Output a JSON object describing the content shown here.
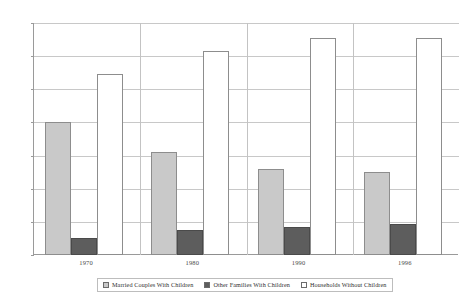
{
  "chart_data": {
    "type": "bar",
    "title": "",
    "subtitle": "",
    "xlabel": "",
    "ylabel": "",
    "categories": [
      "1970",
      "1980",
      "1990",
      "1996"
    ],
    "series": [
      {
        "name": "Married Couples With Children",
        "color": "#c9c9c9",
        "values": [
          40,
          31,
          26,
          25
        ]
      },
      {
        "name": "Other Families With Children",
        "color": "#5d5d5d",
        "values": [
          5,
          7.5,
          8.5,
          9.5
        ]
      },
      {
        "name": "Households Without Children",
        "color": "#ffffff",
        "values": [
          54.5,
          61.5,
          65.5,
          65.5
        ]
      }
    ],
    "ylim": [
      0,
      70
    ],
    "yticks": [
      0,
      10,
      20,
      30,
      40,
      50,
      60,
      70
    ],
    "ytick_labels": [
      "0",
      "10",
      "20",
      "30",
      "40",
      "50",
      "60",
      "70"
    ],
    "grid": true,
    "legend_position": "bottom"
  },
  "legend": {
    "items": [
      {
        "label": "Married Couples With Children"
      },
      {
        "label": "Other Families With Children"
      },
      {
        "label": "Households Without Children"
      }
    ]
  },
  "axis": {
    "y_labels": [
      "70",
      "60",
      "50",
      "40",
      "30",
      "20",
      "10",
      "0"
    ],
    "x_labels": [
      "1970",
      "1980",
      "1990",
      "1996"
    ]
  }
}
